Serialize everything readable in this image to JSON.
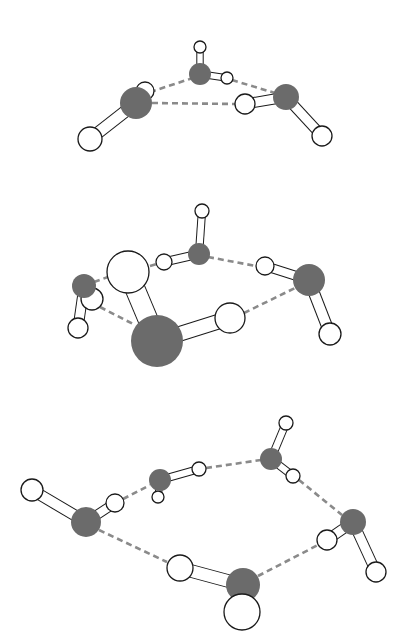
{
  "figure": {
    "colors": {
      "oxygen": "#6b6b6b",
      "hydrogen": "#ffffff",
      "outline": "#1a1a1a",
      "hbond": "#8a8a8a",
      "background": "#ffffff"
    }
  },
  "clusters": [
    {
      "name": "trimer",
      "molecules": [
        {
          "O": [
            200,
            74,
            11
          ],
          "H": [
            [
              200,
              47,
              6
            ],
            [
              227,
              78,
              6
            ]
          ]
        },
        {
          "O": [
            136,
            103,
            16
          ],
          "H": [
            [
              145,
              91,
              9
            ],
            [
              90,
              139,
              12
            ]
          ]
        },
        {
          "O": [
            286,
            97,
            13
          ],
          "H": [
            [
              245,
              104,
              10
            ],
            [
              322,
              136,
              10
            ]
          ]
        }
      ],
      "hbonds": [
        [
          150,
          92,
          193,
          78
        ],
        [
          152,
          103,
          235,
          104
        ],
        [
          232,
          80,
          275,
          93
        ]
      ]
    },
    {
      "name": "tetramer",
      "molecules": [
        {
          "O": [
            199,
            254,
            11
          ],
          "H": [
            [
              202,
              211,
              7
            ],
            [
              164,
              262,
              8
            ]
          ]
        },
        {
          "O": [
            84,
            286,
            12
          ],
          "H": [
            [
              92,
              299,
              11
            ],
            [
              78,
              328,
              10
            ]
          ]
        },
        {
          "O": [
            157,
            341,
            26
          ],
          "H": [
            [
              128,
              272,
              21
            ],
            [
              230,
              318,
              15
            ]
          ]
        },
        {
          "O": [
            309,
            280,
            16
          ],
          "H": [
            [
              265,
              266,
              9
            ],
            [
              330,
              334,
              11
            ]
          ]
        }
      ],
      "hbonds": [
        [
          150,
          266,
          157,
          264
        ],
        [
          94,
          282,
          108,
          277
        ],
        [
          100,
          307,
          135,
          325
        ],
        [
          208,
          257,
          256,
          266
        ],
        [
          244,
          313,
          295,
          288
        ]
      ]
    },
    {
      "name": "pentamer",
      "molecules": [
        {
          "O": [
            86,
            522,
            15
          ],
          "H": [
            [
              32,
              490,
              11
            ],
            [
              115,
              503,
              9
            ]
          ]
        },
        {
          "O": [
            160,
            480,
            11
          ],
          "H": [
            [
              158,
              497,
              6
            ],
            [
              199,
              469,
              7
            ]
          ]
        },
        {
          "O": [
            271,
            459,
            11
          ],
          "H": [
            [
              286,
              423,
              7
            ],
            [
              293,
              476,
              7
            ]
          ]
        },
        {
          "O": [
            353,
            522,
            13
          ],
          "H": [
            [
              327,
              540,
              10
            ],
            [
              376,
              572,
              10
            ]
          ]
        },
        {
          "O": [
            243,
            585,
            17
          ],
          "H": [
            [
              180,
              568,
              13
            ],
            [
              242,
              612,
              18
            ]
          ]
        }
      ],
      "hbonds": [
        [
          123,
          499,
          150,
          485
        ],
        [
          206,
          468,
          261,
          460
        ],
        [
          299,
          480,
          342,
          515
        ],
        [
          99,
          530,
          167,
          562
        ],
        [
          258,
          576,
          318,
          545
        ]
      ]
    }
  ]
}
